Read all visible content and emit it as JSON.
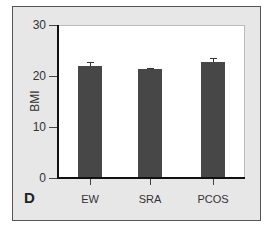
{
  "chart_data": {
    "type": "bar",
    "title": "",
    "panel_label": "D",
    "xlabel": "",
    "ylabel": "BMI",
    "ylim": [
      0,
      30
    ],
    "yticks": [
      0,
      10,
      20,
      30
    ],
    "categories": [
      "EW",
      "SRA",
      "PCOS"
    ],
    "values": [
      22.0,
      21.4,
      22.7
    ],
    "error_bars": [
      0.7,
      0.2,
      0.8
    ],
    "bar_color": "#474747",
    "background_color": "#e7e7e7",
    "grid": false,
    "legend": null
  },
  "labels": {
    "panel": "D",
    "ylabel": "BMI",
    "yticks": [
      "0",
      "10",
      "20",
      "30"
    ],
    "xticks": [
      "EW",
      "SRA",
      "PCOS"
    ]
  }
}
